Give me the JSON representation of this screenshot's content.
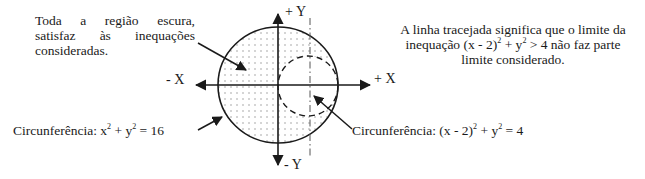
{
  "annotations": {
    "region_note": {
      "lines": [
        "Toda a região escura,",
        "satisfaz às inequações",
        "consideradas."
      ]
    },
    "dashed_note": {
      "line1": "A linha tracejada significa que o limite da",
      "line2_prefix": "inequação (x - 2)",
      "line2_exp1": "2",
      "line2_mid": " + y",
      "line2_exp2": "2",
      "line2_suffix": " > 4 não faz parte",
      "line3": "limite considerado."
    },
    "big_circle_label": {
      "prefix": "Circunferência: x",
      "exp1": "2",
      "mid": " + y",
      "exp2": "2",
      "suffix": " = 16"
    },
    "small_circle_label": {
      "prefix": "Circunferência: (x - 2)",
      "exp1": "2",
      "mid": " + y",
      "exp2": "2",
      "suffix": " = 4"
    }
  },
  "axes": {
    "pos_y": "+ Y",
    "neg_y": "- Y",
    "pos_x": "+ X",
    "neg_x": "- X"
  },
  "geometry": {
    "big_circle": {
      "equation": "x^2 + y^2 = 16",
      "radius": 4,
      "center": [
        0,
        0
      ],
      "style": "solid"
    },
    "small_circle": {
      "equation": "(x - 2)^2 + y^2 = 4",
      "radius": 2,
      "center": [
        2,
        0
      ],
      "style": "dashed"
    },
    "vertical_line": {
      "x": 2,
      "style": "dash-dot"
    },
    "shaded_region": "x^2 + y^2 <= 16 and (x - 2)^2 + y^2 > 4"
  },
  "colors": {
    "stroke": "#1a1a1a",
    "dots": "#8a8a8a",
    "background": "#ffffff"
  }
}
